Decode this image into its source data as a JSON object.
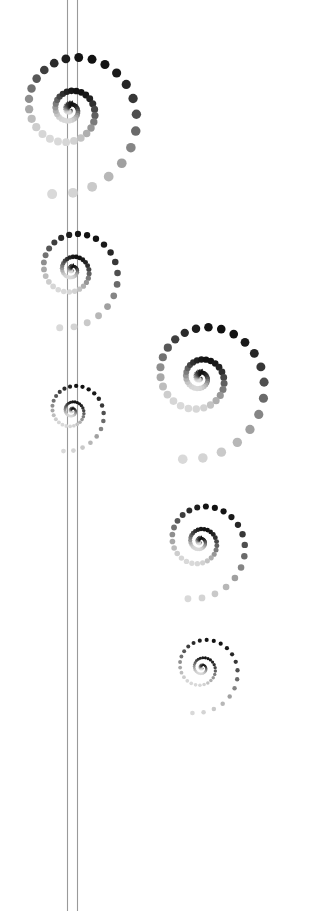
{
  "artwork": {
    "title": "Dotted Spiral Composition",
    "alt_text": "Abstract decorative artwork: six dotted spiral rosettes arranged along and beside a pair of thin vertical lines on a white background",
    "width": 330,
    "height": 911,
    "background_color": "#ffffff"
  },
  "stem": {
    "name": "double-vertical-line",
    "color": "#9a9a9a",
    "line_width": 1.1,
    "x_positions": [
      67.5,
      77.5
    ],
    "y_start": 0,
    "y_end": 911
  },
  "palette": {
    "lightest": "#ededed",
    "light": "#d2d2d2",
    "mid_light": "#a8a8a8",
    "mid": "#7d7d7d",
    "mid_dark": "#555555",
    "dark": "#2e2e2e",
    "darkest": "#111111"
  },
  "spiral_defaults": {
    "turns": 3.6,
    "dots_per_turn": 26,
    "growth": 2.45,
    "inner_dash_fraction": 0.3,
    "start_angle_deg": -96,
    "sweep": "clockwise"
  },
  "spirals": [
    {
      "id": "spiral-1",
      "label": "Large spiral on stem (top)",
      "cx": 70,
      "cy": 110,
      "radius": 86,
      "max_dot_radius": 5.0,
      "min_dot_radius": 0.5,
      "turns": 3.55,
      "dots_per_turn": 26,
      "phase_deg": -96,
      "opacity": 1
    },
    {
      "id": "spiral-2",
      "label": "Medium spiral on stem",
      "cx": 72,
      "cy": 270,
      "radius": 59,
      "max_dot_radius": 3.5,
      "min_dot_radius": 0.4,
      "turns": 3.55,
      "dots_per_turn": 26,
      "phase_deg": -96,
      "opacity": 1
    },
    {
      "id": "spiral-3",
      "label": "Small spiral on stem",
      "cx": 72,
      "cy": 411,
      "radius": 41,
      "max_dot_radius": 2.4,
      "min_dot_radius": 0.3,
      "turns": 3.55,
      "dots_per_turn": 26,
      "phase_deg": -96,
      "opacity": 1
    },
    {
      "id": "spiral-4",
      "label": "Large spiral right side",
      "cx": 200,
      "cy": 378,
      "radius": 83,
      "max_dot_radius": 4.8,
      "min_dot_radius": 0.5,
      "turns": 3.55,
      "dots_per_turn": 26,
      "phase_deg": -96,
      "opacity": 1
    },
    {
      "id": "spiral-5",
      "label": "Medium spiral right side",
      "cx": 200,
      "cy": 542,
      "radius": 58,
      "max_dot_radius": 3.4,
      "min_dot_radius": 0.4,
      "turns": 3.55,
      "dots_per_turn": 26,
      "phase_deg": -96,
      "opacity": 1
    },
    {
      "id": "spiral-6",
      "label": "Smallest spiral right side bottom",
      "cx": 202,
      "cy": 668,
      "radius": 46,
      "max_dot_radius": 2.3,
      "min_dot_radius": 0.3,
      "turns": 3.55,
      "dots_per_turn": 26,
      "phase_deg": -96,
      "opacity": 1
    }
  ]
}
